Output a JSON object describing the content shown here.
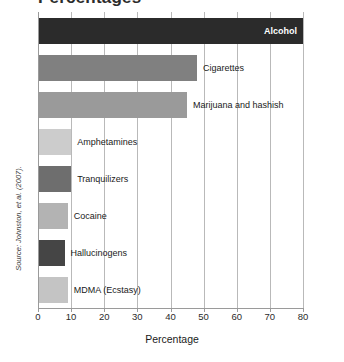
{
  "chart_data": {
    "type": "bar",
    "orientation": "horizontal",
    "title": "Percentage",
    "xlabel": "Percentage",
    "ylabel": "",
    "xlim": [
      0,
      80
    ],
    "grid": true,
    "legend": "none",
    "categories": [
      "Alcohol",
      "Cigarettes",
      "Marijuana and hashish",
      "Amphetamines",
      "Tranquilizers",
      "Cocaine",
      "Hallucinogens",
      "MDMA (Ecstasy)"
    ],
    "values": [
      80,
      48,
      45,
      10,
      10,
      9,
      8,
      9
    ],
    "tick_labels": [
      "0",
      "10",
      "20",
      "30",
      "40",
      "50",
      "60",
      "70",
      "80"
    ],
    "tick_values": [
      0,
      10,
      20,
      30,
      40,
      50,
      60,
      70,
      80
    ],
    "bar_colors": [
      "#2b2b2b",
      "#808080",
      "#9a9a9a",
      "#cccccc",
      "#6e6e6e",
      "#b3b3b3",
      "#454545",
      "#c4c4c4"
    ],
    "label_inside": [
      true,
      false,
      false,
      false,
      false,
      false,
      false,
      false
    ],
    "annotations": [
      "Source: Johnston, et al. (2007)."
    ]
  },
  "figure": {
    "title_partial": "Percentages",
    "source": "Source: Johnston, et al. (2007).",
    "axis_title": "Percentage"
  }
}
